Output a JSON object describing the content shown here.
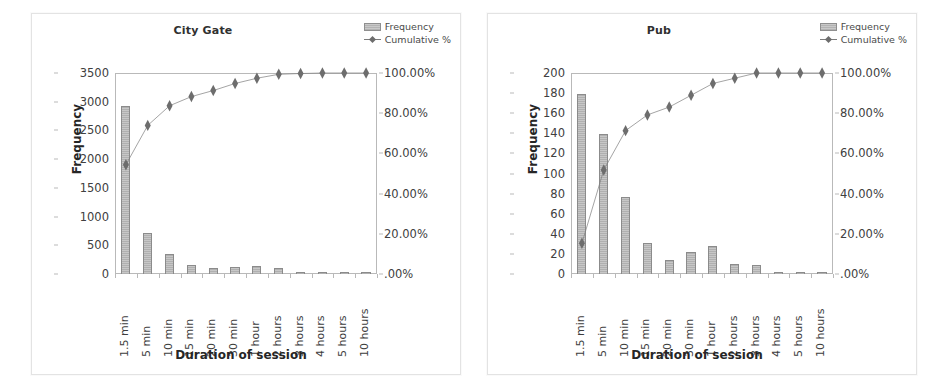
{
  "figure": {
    "background": "#ffffff",
    "bar_color": "#bdbdbd",
    "bar_border": "#8b8b8b",
    "line_color": "#7c7c7c",
    "marker_color": "#6d6d6d"
  },
  "legend": {
    "frequency_label": "Frequency",
    "cumulative_label": "Cumulative %"
  },
  "chart_data": [
    {
      "type": "bar",
      "id": "city-gate",
      "title": "City Gate",
      "xlabel": "Duration of session",
      "ylabel": "Frequency",
      "grid": false,
      "legend_position": "top-right",
      "categories": [
        "1.5 min",
        "5 min",
        "10 min",
        "15 min",
        "20 min",
        "30 min",
        "1 hour",
        "2 hours",
        "3 hours",
        "4 hours",
        "5 hours",
        "10 hours"
      ],
      "ylim": [
        0,
        3500
      ],
      "yticks": [
        0,
        500,
        1000,
        1500,
        2000,
        2500,
        3000,
        3500
      ],
      "ytick_labels": [
        "0",
        "500",
        "1000",
        "1500",
        "2000",
        "2500",
        "3000",
        "3500"
      ],
      "y2lim": [
        0,
        100
      ],
      "y2ticks": [
        0,
        20,
        40,
        60,
        80,
        100
      ],
      "y2tick_labels": [
        ".00%",
        "20.00%",
        "40.00%",
        "60.00%",
        "80.00%",
        "100.00%"
      ],
      "series": [
        {
          "name": "Frequency",
          "axis": "left",
          "kind": "bar",
          "values": [
            2920,
            720,
            340,
            165,
            110,
            130,
            135,
            105,
            25,
            25,
            15,
            15
          ]
        },
        {
          "name": "Cumulative %",
          "axis": "right",
          "kind": "line",
          "values": [
            65.0,
            80.0,
            87.5,
            91.0,
            93.3,
            96.0,
            98.0,
            99.5,
            99.8,
            100.0,
            100.0,
            100.0
          ]
        }
      ]
    },
    {
      "type": "bar",
      "id": "pub",
      "title": "Pub",
      "xlabel": "Duration of session",
      "ylabel": "Frequency",
      "grid": false,
      "legend_position": "top-right",
      "categories": [
        "1.5 min",
        "5 min",
        "10 min",
        "15 min",
        "20 min",
        "30 min",
        "1 hour",
        "2 hours",
        "3 hours",
        "4 hours",
        "5 hours",
        "10 hours"
      ],
      "ylim": [
        0,
        200
      ],
      "yticks": [
        0,
        20,
        40,
        60,
        80,
        100,
        120,
        140,
        160,
        180,
        200
      ],
      "ytick_labels": [
        "0",
        "20",
        "40",
        "60",
        "80",
        "100",
        "120",
        "140",
        "160",
        "180",
        "200"
      ],
      "y2lim": [
        0,
        100
      ],
      "y2ticks": [
        0,
        20,
        40,
        60,
        80,
        100
      ],
      "y2tick_labels": [
        ".00%",
        "20.00%",
        "40.00%",
        "60.00%",
        "80.00%",
        "100.00%"
      ],
      "series": [
        {
          "name": "Frequency",
          "axis": "left",
          "kind": "bar",
          "values": [
            179,
            139,
            77,
            31,
            14,
            22,
            28,
            10,
            9,
            1,
            1,
            2
          ]
        },
        {
          "name": "Cumulative %",
          "axis": "right",
          "kind": "line",
          "values": [
            35.0,
            63.0,
            78.0,
            84.0,
            87.0,
            91.5,
            96.0,
            98.0,
            100.0,
            100.0,
            100.0,
            100.0
          ]
        }
      ]
    }
  ]
}
